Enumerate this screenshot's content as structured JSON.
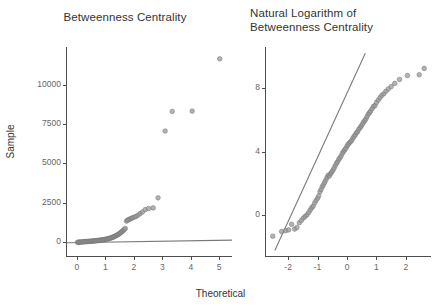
{
  "figure": {
    "width": 441,
    "height": 308,
    "background": "#ffffff",
    "shared_xlabel": "Theoretical",
    "shared_ylabel": "Sample",
    "point_color": "#999999",
    "line_color": "#7a7a7a",
    "axis_color": "#4d4d4d",
    "text_color": "#333333",
    "ticklabel_color": "#666666"
  },
  "chart_data": [
    {
      "type": "scatter",
      "panel": "left",
      "title": "Betweenness Centrality",
      "xlabel": "Theoretical",
      "ylabel": "Sample",
      "grid": false,
      "legend": "none",
      "xlim": [
        -0.35,
        5.45
      ],
      "ylim": [
        -900,
        12400
      ],
      "xticks": [
        0,
        1,
        2,
        3,
        4,
        5
      ],
      "xticklabels": [
        "0",
        "1",
        "2",
        "3",
        "4",
        "5"
      ],
      "yticks": [
        0,
        2500,
        5000,
        7500,
        10000
      ],
      "yticklabels": [
        "0",
        "2500",
        "5000",
        "7500",
        "10000"
      ],
      "reference_line": {
        "x": [
          -0.35,
          5.45
        ],
        "y": [
          -60,
          110
        ]
      },
      "x": [
        0.02,
        0.05,
        0.08,
        0.11,
        0.14,
        0.17,
        0.2,
        0.23,
        0.26,
        0.29,
        0.32,
        0.35,
        0.38,
        0.41,
        0.44,
        0.47,
        0.5,
        0.53,
        0.56,
        0.59,
        0.62,
        0.65,
        0.68,
        0.71,
        0.74,
        0.77,
        0.8,
        0.83,
        0.86,
        0.89,
        0.92,
        0.95,
        0.98,
        1.01,
        1.04,
        1.07,
        1.1,
        1.13,
        1.16,
        1.19,
        1.22,
        1.25,
        1.28,
        1.31,
        1.34,
        1.37,
        1.4,
        1.43,
        1.46,
        1.49,
        1.52,
        1.55,
        1.58,
        1.61,
        1.64,
        1.67,
        1.7,
        1.74,
        1.78,
        1.82,
        1.87,
        1.92,
        1.97,
        2.02,
        2.08,
        2.15,
        2.22,
        2.3,
        2.4,
        2.52,
        2.68,
        2.85,
        3.1,
        3.35,
        4.05,
        5.02
      ],
      "y": [
        -30,
        -25,
        -20,
        -15,
        -10,
        -5,
        0,
        5,
        10,
        14,
        18,
        22,
        26,
        30,
        34,
        38,
        42,
        47,
        52,
        57,
        62,
        68,
        74,
        80,
        86,
        93,
        100,
        108,
        116,
        124,
        133,
        142,
        152,
        163,
        175,
        188,
        202,
        217,
        233,
        250,
        268,
        288,
        310,
        334,
        360,
        388,
        418,
        450,
        485,
        522,
        562,
        605,
        650,
        698,
        748,
        800,
        852,
        1320,
        1380,
        1420,
        1460,
        1500,
        1540,
        1580,
        1620,
        1700,
        1800,
        1900,
        2050,
        2120,
        2160,
        2800,
        7050,
        8300,
        8320,
        11650
      ]
    },
    {
      "type": "scatter",
      "panel": "right",
      "title": "Natural Logarithm of\nBetweenness Centrality",
      "xlabel": "Theoretical",
      "ylabel": "Sample",
      "grid": false,
      "legend": "none",
      "xlim": [
        -2.75,
        2.85
      ],
      "ylim": [
        -2.6,
        10.6
      ],
      "xticks": [
        -2,
        -1,
        0,
        1,
        2
      ],
      "xticklabels": [
        "-2",
        "-1",
        "0",
        "1",
        "2"
      ],
      "yticks": [
        0,
        4,
        8
      ],
      "yticklabels": [
        "0",
        "4",
        "8"
      ],
      "reference_line": {
        "x": [
          -2.45,
          0.62
        ],
        "y": [
          -2.25,
          10.2
        ]
      },
      "x": [
        -2.52,
        -2.22,
        -2.08,
        -1.98,
        -1.88,
        -1.78,
        -1.7,
        -1.62,
        -1.55,
        -1.48,
        -1.42,
        -1.36,
        -1.3,
        -1.25,
        -1.2,
        -1.15,
        -1.1,
        -1.05,
        -1.0,
        -0.96,
        -0.92,
        -0.88,
        -0.84,
        -0.8,
        -0.76,
        -0.72,
        -0.68,
        -0.64,
        -0.6,
        -0.56,
        -0.52,
        -0.48,
        -0.44,
        -0.4,
        -0.36,
        -0.32,
        -0.28,
        -0.24,
        -0.2,
        -0.16,
        -0.12,
        -0.08,
        -0.04,
        0.0,
        0.04,
        0.08,
        0.12,
        0.16,
        0.2,
        0.24,
        0.28,
        0.32,
        0.36,
        0.4,
        0.44,
        0.48,
        0.52,
        0.56,
        0.6,
        0.64,
        0.68,
        0.72,
        0.76,
        0.8,
        0.85,
        0.9,
        0.95,
        1.0,
        1.06,
        1.12,
        1.18,
        1.25,
        1.32,
        1.4,
        1.5,
        1.62,
        1.78,
        2.05,
        2.45,
        2.62
      ],
      "y": [
        -1.35,
        -1.05,
        -1.0,
        -0.95,
        -0.6,
        -0.9,
        -0.8,
        -0.5,
        -0.35,
        -0.2,
        -0.1,
        0.0,
        0.15,
        0.3,
        0.45,
        0.55,
        0.75,
        0.9,
        1.05,
        1.2,
        1.45,
        1.6,
        1.78,
        1.9,
        2.05,
        2.2,
        2.35,
        2.5,
        2.45,
        2.6,
        2.7,
        2.8,
        2.95,
        3.1,
        3.25,
        3.35,
        3.5,
        3.6,
        3.72,
        3.88,
        4.0,
        4.1,
        4.2,
        4.35,
        4.45,
        4.55,
        4.62,
        4.7,
        4.85,
        4.95,
        5.05,
        5.18,
        5.25,
        5.4,
        5.5,
        5.6,
        5.72,
        5.85,
        5.95,
        6.05,
        6.2,
        6.35,
        6.45,
        6.55,
        6.7,
        6.85,
        6.9,
        7.1,
        7.25,
        7.4,
        7.55,
        7.65,
        7.8,
        7.95,
        8.1,
        8.3,
        8.55,
        8.8,
        8.85,
        9.25
      ]
    }
  ]
}
